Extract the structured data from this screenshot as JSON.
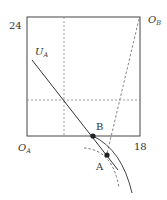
{
  "diagram": {
    "type": "edgeworth-box",
    "axis_labels": {
      "y_max": "24",
      "x_max": "18"
    },
    "origin_a": {
      "main": "O",
      "sub": "A"
    },
    "origin_b": {
      "main": "O",
      "sub": "B"
    },
    "curve_label": {
      "main": "U",
      "sub": "A"
    },
    "points": [
      {
        "label": "B"
      },
      {
        "label": "A"
      }
    ],
    "colors": {
      "line": "#333333",
      "dashed": "#666666",
      "point": "#222222"
    }
  }
}
